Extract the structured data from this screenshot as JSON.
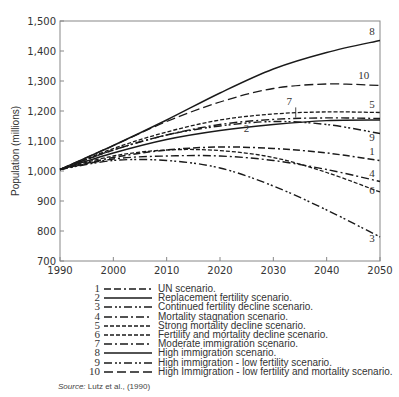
{
  "chart_data": {
    "type": "line",
    "title": "",
    "xlabel": "",
    "ylabel": "Population (millions)",
    "xlim": [
      1990,
      2050
    ],
    "ylim": [
      700,
      1500
    ],
    "x_ticks": [
      1990,
      2000,
      2010,
      2020,
      2030,
      2040,
      2050
    ],
    "y_ticks": [
      700,
      800,
      900,
      1000,
      1100,
      1200,
      1300,
      1400,
      1500
    ],
    "x_tick_labels": [
      "1990",
      "2000",
      "2010",
      "2020",
      "2030",
      "2040",
      "2050"
    ],
    "y_tick_labels": [
      "700",
      "800",
      "900",
      "1,000",
      "1,100",
      "1,200",
      "1,300",
      "1,400",
      "1,500"
    ],
    "grid": false,
    "legend_position": "below",
    "x": [
      1990,
      2000,
      2010,
      2020,
      2030,
      2040,
      2050
    ],
    "series": [
      {
        "id": "1",
        "name": "UN scenario.",
        "dash": "dash-dot-long",
        "values": [
          1005,
          1045,
          1070,
          1080,
          1075,
          1060,
          1035
        ]
      },
      {
        "id": "2",
        "name": "Replacement fertility scenario.",
        "dash": "solid",
        "values": [
          1005,
          1060,
          1105,
          1135,
          1155,
          1168,
          1170
        ]
      },
      {
        "id": "3",
        "name": "Continued fertility decline scenario.",
        "dash": "dash-dot-dot",
        "values": [
          1005,
          1035,
          1035,
          1010,
          950,
          870,
          780
        ]
      },
      {
        "id": "4",
        "name": "Mortality stagnation scenario.",
        "dash": "dash-dot",
        "values": [
          1005,
          1040,
          1050,
          1050,
          1035,
          1005,
          965
        ]
      },
      {
        "id": "5",
        "name": "Strong mortality decline scenario.",
        "dash": "short-dash",
        "values": [
          1005,
          1075,
          1130,
          1170,
          1190,
          1197,
          1195
        ]
      },
      {
        "id": "6",
        "name": "Fertility and mortality decline scenario.",
        "dash": "short-dash",
        "values": [
          1005,
          1050,
          1070,
          1068,
          1045,
          995,
          930
        ]
      },
      {
        "id": "7",
        "name": "Moderate immigration scenario.",
        "dash": "dash-dot",
        "values": [
          1005,
          1070,
          1120,
          1155,
          1172,
          1177,
          1175
        ]
      },
      {
        "id": "8",
        "name": "High immigration scenario.",
        "dash": "solid",
        "values": [
          1005,
          1085,
          1170,
          1260,
          1340,
          1395,
          1435
        ]
      },
      {
        "id": "9",
        "name": "High immigration - low fertility scenario.",
        "dash": "dash-dot-dot",
        "values": [
          1005,
          1070,
          1120,
          1150,
          1165,
          1155,
          1125
        ]
      },
      {
        "id": "10",
        "name": "High Immigration - low fertility and mortality scenario.",
        "dash": "long-dash",
        "values": [
          1005,
          1085,
          1165,
          1230,
          1275,
          1290,
          1285
        ]
      }
    ],
    "curve_labels": [
      {
        "text": "8",
        "x": 2049,
        "y": 1455
      },
      {
        "text": "10",
        "x": 2048,
        "y": 1307
      },
      {
        "text": "7",
        "x": 2033.5,
        "y": 1220
      },
      {
        "text": "5",
        "x": 2049,
        "y": 1210
      },
      {
        "text": "2",
        "x": 2025.5,
        "y": 1130
      },
      {
        "text": "9",
        "x": 2049,
        "y": 1100
      },
      {
        "text": "1",
        "x": 2049,
        "y": 1052
      },
      {
        "text": "4",
        "x": 2049,
        "y": 980
      },
      {
        "text": "6",
        "x": 2049,
        "y": 922
      },
      {
        "text": "3",
        "x": 2049,
        "y": 765
      }
    ],
    "source": "Lutz et al., (1990)"
  },
  "source": {
    "label": "Source:",
    "text": "Lutz et al., (1990)"
  },
  "colors": {
    "line": "#1a1a1a",
    "axis": "#888888",
    "text": "#333333"
  }
}
